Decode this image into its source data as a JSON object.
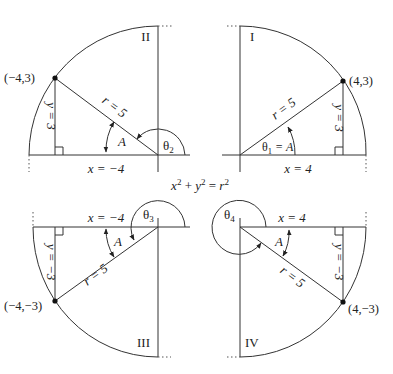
{
  "equation": {
    "base": "x",
    "plus": " + ",
    "y": "y",
    "eq": " = ",
    "r": "r",
    "exp": "2"
  },
  "quadrants": [
    {
      "roman": "II",
      "point": "(−4,3)",
      "x_label": "x = −4",
      "y_label": "y = 3",
      "r_label": "r = 5",
      "ref_angle": "A",
      "theta": "θ",
      "theta_sub": "2"
    },
    {
      "roman": "I",
      "point": "(4,3)",
      "x_label": "x = 4",
      "y_label": "y = 3",
      "r_label": "r = 5",
      "theta_eq": "θ",
      "theta_sub": "1",
      "theta_rest": " = A"
    },
    {
      "roman": "III",
      "point": "(−4,−3)",
      "x_label": "x = −4",
      "y_label": "y = −3",
      "r_label": "r = 5",
      "ref_angle": "A",
      "theta": "θ",
      "theta_sub": "3"
    },
    {
      "roman": "IV",
      "point": "(4,−3)",
      "x_label": "x = 4",
      "y_label": "y = −3",
      "r_label": "r = 5",
      "ref_angle": "A",
      "theta": "θ",
      "theta_sub": "4"
    }
  ],
  "colors": {
    "line": "#333333",
    "background": "#ffffff"
  }
}
